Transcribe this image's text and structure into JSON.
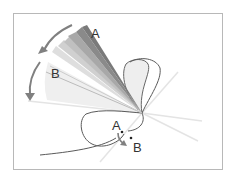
{
  "diagram": {
    "labels": {
      "top_a": "A",
      "top_b": "B",
      "bottom_a": "A",
      "bottom_b": "B"
    },
    "colors": {
      "frame": "#b8b8b8",
      "dark_band": "#7a7a7a",
      "mid_band": "#a6a6a6",
      "light_band": "#d2d2d2",
      "fan_fill": "#ececec",
      "curve": "#555555",
      "arrow": "#808080",
      "light_ray": "#e2e2e2"
    }
  }
}
